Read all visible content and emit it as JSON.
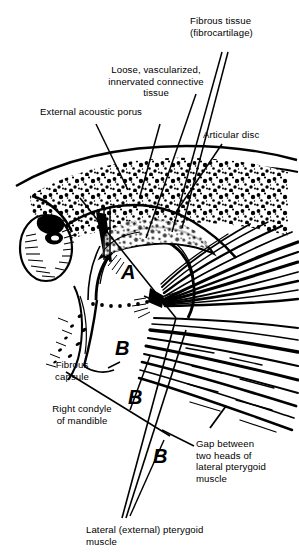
{
  "figure": {
    "background_color": "#ffffff",
    "ink_color": "#000000",
    "width": 299,
    "height": 555
  },
  "labels": {
    "fibrous_tissue": "Fibrous tissue\n(fibrocartilage)",
    "loose_connective_tissue": "Loose, vascularized,\ninnervated connective tissue",
    "external_acoustic_porus": "External acoustic porus",
    "articular_disc": "Articular disc",
    "fibrous_capsule": "Fibrous\ncapsule",
    "right_condyle": "Right condyle\nof mandible",
    "gap_two_heads": "Gap between\ntwo heads of\nlateral pterygoid\nmuscle",
    "bottom_caption": "Lateral (external) pterygoid\nmuscle"
  },
  "region_letters": {
    "a": "A",
    "b1": "B",
    "b2": "B",
    "b3": "B"
  }
}
